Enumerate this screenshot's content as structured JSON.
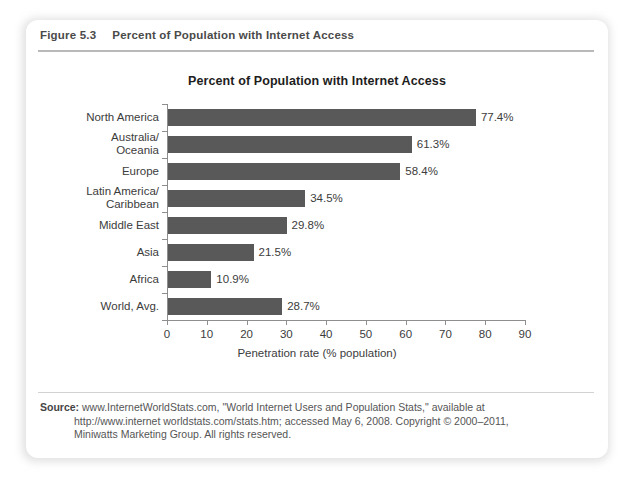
{
  "figure": {
    "number": "Figure 5.3",
    "caption": "Percent of Population with Internet Access"
  },
  "chart_data": {
    "type": "bar",
    "orientation": "horizontal",
    "title": "Percent of Population with Internet Access",
    "xlabel": "Penetration rate (% population)",
    "ylabel": "",
    "xlim": [
      0,
      90
    ],
    "xticks": [
      "0",
      "10",
      "20",
      "30",
      "40",
      "50",
      "60",
      "70",
      "80",
      "90"
    ],
    "grid": false,
    "legend": "none",
    "bar_color": "#595959",
    "categories": [
      "North America",
      "Australia/ Oceania",
      "Europe",
      "Latin America/ Caribbean",
      "Middle East",
      "Asia",
      "Africa",
      "World, Avg."
    ],
    "category_lines": [
      [
        "North America"
      ],
      [
        "Australia/",
        "Oceania"
      ],
      [
        "Europe"
      ],
      [
        "Latin America/",
        "Caribbean"
      ],
      [
        "Middle East"
      ],
      [
        "Asia"
      ],
      [
        "Africa"
      ],
      [
        "World, Avg."
      ]
    ],
    "values": [
      77.4,
      61.3,
      58.4,
      34.5,
      29.8,
      21.5,
      10.9,
      28.7
    ],
    "value_labels": [
      "77.4%",
      "61.3%",
      "58.4%",
      "34.5%",
      "29.8%",
      "21.5%",
      "10.9%",
      "28.7%"
    ]
  },
  "source": {
    "label": "Source:",
    "line1": "www.InternetWorldStats.com, \"World Internet Users and Population Stats,\" available at",
    "line2": "http://www.internet worldstats.com/stats.htm; accessed May 6, 2008. Copyright © 2000–2011,",
    "line3": "Miniwatts Marketing Group. All rights reserved."
  }
}
